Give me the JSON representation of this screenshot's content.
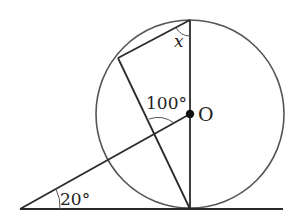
{
  "diagram": {
    "type": "geometry",
    "labels": {
      "angle_x": "x",
      "angle_center": "100°",
      "angle_base": "20°",
      "center": "O"
    },
    "colors": {
      "stroke": "#2a2a2a",
      "circle": "#555555",
      "background": "#ffffff"
    }
  }
}
